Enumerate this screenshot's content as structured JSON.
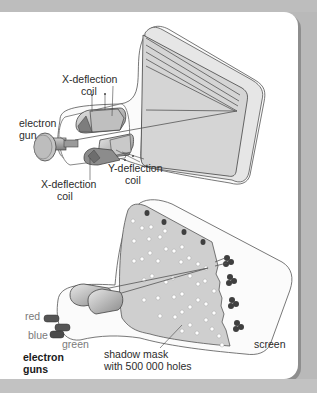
{
  "diagram": {
    "top": {
      "title": "Monochrome cathode ray tube",
      "labels": {
        "x_deflection_top_1": "X-deflection",
        "x_deflection_top_2": "coil",
        "electron_gun_1": "electron",
        "electron_gun_2": "gun",
        "y_deflection_1": "Y-deflection",
        "y_deflection_2": "coil",
        "x_deflection_bottom_1": "X-deflection",
        "x_deflection_bottom_2": "coil"
      }
    },
    "bottom": {
      "title": "Colour cathode ray tube with shadow mask",
      "labels": {
        "red": "red",
        "blue": "blue",
        "green": "green",
        "electron_guns_1": "electron",
        "electron_guns_2": "guns",
        "shadow_mask_1": "shadow mask",
        "shadow_mask_2": "with 500 000 holes",
        "screen": "screen"
      }
    },
    "colors": {
      "background": "#b9b9b9",
      "panel": "#ffffff",
      "screen_fill": "#d4d4d4",
      "outline": "#4a4a4a"
    }
  }
}
